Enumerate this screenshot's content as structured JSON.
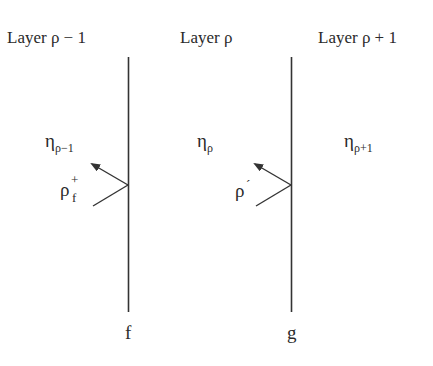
{
  "diagram": {
    "layers": [
      {
        "label": "Layer ρ − 1",
        "eta": "η",
        "eta_sub": "ρ−1"
      },
      {
        "label": "Layer ρ",
        "eta": "η",
        "eta_sub": "ρ"
      },
      {
        "label": "Layer ρ + 1",
        "eta": "η",
        "eta_sub": "ρ+1"
      }
    ],
    "interfaces": [
      {
        "name": "f",
        "reflection_label": "ρ",
        "reflection_sup": "+",
        "reflection_sub": "f"
      },
      {
        "name": "g",
        "reflection_label": "ρ",
        "reflection_prime": "´"
      }
    ],
    "colors": {
      "line": "#333333",
      "text": "#2a2a2a"
    }
  }
}
